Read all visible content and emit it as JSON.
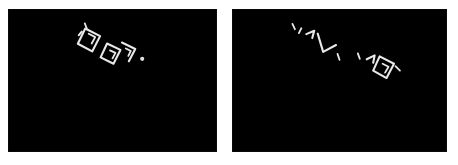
{
  "figure": {
    "type": "image-pair",
    "background_color": "#ffffff",
    "panel_background_color": "#000000",
    "mark_color": "#e8e8e8",
    "panel_count": 2,
    "width": 458,
    "height": 165
  },
  "panels": [
    {
      "id": "left",
      "name": "left-image-panel",
      "caption": "",
      "x": 8,
      "y": 9,
      "width": 209,
      "height": 143,
      "background_color": "#000000",
      "content_description": "diagonal cluster of white stroke marks",
      "mark_count": 5,
      "cluster_angle_deg": 35
    },
    {
      "id": "right",
      "name": "right-image-panel",
      "caption": "",
      "x": 232,
      "y": 9,
      "width": 215,
      "height": 143,
      "background_color": "#000000",
      "content_description": "diagonal cluster of fragmented white stroke marks",
      "mark_count": 6,
      "cluster_angle_deg": 38
    }
  ]
}
